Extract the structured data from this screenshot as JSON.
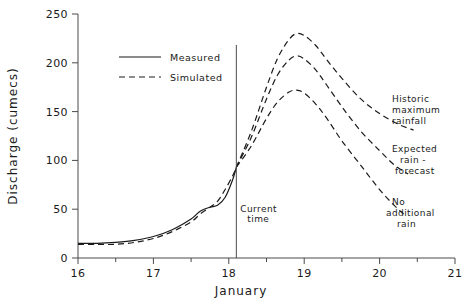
{
  "chart_data": {
    "type": "line",
    "title": "",
    "xlabel": "January",
    "ylabel": "Discharge (cumecs)",
    "xlim": [
      16,
      21
    ],
    "ylim": [
      0,
      250
    ],
    "grid": false,
    "x_ticks": [
      "16",
      "17",
      "18",
      "19",
      "20",
      "21"
    ],
    "x_tick_values": [
      16,
      17,
      18,
      19,
      20,
      21
    ],
    "x_minor_ticks": [
      16.5,
      17.5,
      18.5,
      19.5,
      20.5
    ],
    "y_ticks": [
      "0",
      "50",
      "100",
      "150",
      "200",
      "250"
    ],
    "y_tick_values": [
      0,
      50,
      100,
      150,
      200,
      250
    ],
    "legend": {
      "position": "upper-left-inside",
      "entries": [
        {
          "label": "Measured",
          "style": "solid"
        },
        {
          "label": "Simulated",
          "style": "dashed"
        }
      ]
    },
    "annotations": [
      {
        "name": "current-time",
        "label_line1": "Current",
        "label_line2": "time",
        "x": 18.1,
        "type": "vertical-line"
      },
      {
        "name": "historic-maximum-rainfall",
        "label_line1": "Historic",
        "label_line2": "maximum",
        "label_line3": "rainfall",
        "x": 20.5,
        "y": 140
      },
      {
        "name": "expected-rain-forecast",
        "label_line1": "Expected",
        "label_line2": "rain -",
        "label_line3": "forecast",
        "x": 20.5,
        "y": 95
      },
      {
        "name": "no-additional-rain",
        "label_line1": "No",
        "label_line2": "additional",
        "label_line3": "rain",
        "x": 20.4,
        "y": 52
      }
    ],
    "series": [
      {
        "name": "Measured",
        "style": "solid",
        "x": [
          16.0,
          16.25,
          16.5,
          16.75,
          17.0,
          17.25,
          17.5,
          17.62,
          17.75,
          17.85,
          17.95,
          18.05,
          18.1
        ],
        "values": [
          15,
          15,
          16,
          18,
          22,
          29,
          40,
          48,
          52,
          54,
          62,
          80,
          93
        ]
      },
      {
        "name": "Simulated",
        "style": "dashed",
        "x": [
          16.0,
          16.25,
          16.5,
          16.75,
          17.0,
          17.25,
          17.5,
          17.62,
          17.75,
          17.85,
          17.95,
          18.05,
          18.1
        ],
        "values": [
          14,
          14,
          14,
          16,
          20,
          27,
          37,
          45,
          52,
          58,
          70,
          84,
          93
        ]
      },
      {
        "name": "Historic maximum rainfall",
        "style": "dashed",
        "x": [
          18.1,
          18.3,
          18.5,
          18.65,
          18.8,
          18.9,
          19.0,
          19.15,
          19.3,
          19.5,
          19.75,
          20.0,
          20.25,
          20.45
        ],
        "values": [
          93,
          130,
          175,
          205,
          224,
          230,
          228,
          218,
          203,
          184,
          163,
          148,
          137,
          131
        ]
      },
      {
        "name": "Expected rain - forecast",
        "style": "dashed",
        "x": [
          18.1,
          18.3,
          18.5,
          18.65,
          18.8,
          18.9,
          19.0,
          19.15,
          19.3,
          19.5,
          19.75,
          20.0,
          20.2,
          20.38
        ],
        "values": [
          93,
          124,
          163,
          188,
          203,
          207,
          204,
          193,
          177,
          155,
          130,
          110,
          95,
          86
        ]
      },
      {
        "name": "No additional rain",
        "style": "dashed",
        "x": [
          18.1,
          18.3,
          18.5,
          18.65,
          18.8,
          18.9,
          19.0,
          19.15,
          19.3,
          19.5,
          19.75,
          20.0,
          20.18,
          20.32
        ],
        "values": [
          93,
          115,
          143,
          160,
          170,
          172,
          169,
          158,
          143,
          120,
          95,
          70,
          55,
          45
        ]
      }
    ]
  }
}
